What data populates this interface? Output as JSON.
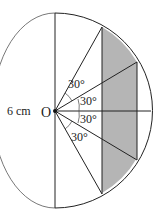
{
  "diagram": {
    "center_label": "O",
    "length_label": "6 cm",
    "angle_labels": [
      "30°",
      "30°",
      "30°",
      "30°"
    ],
    "colors": {
      "shaded": "#b5b5b5",
      "stroke": "#222222",
      "background": "#ffffff"
    }
  }
}
